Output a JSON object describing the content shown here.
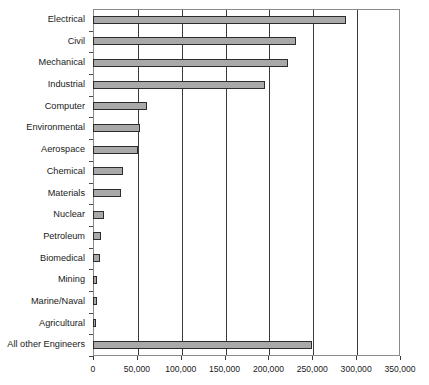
{
  "chart_data": {
    "type": "bar",
    "orientation": "horizontal",
    "title": "",
    "subtitle": "",
    "xlabel": "",
    "ylabel": "",
    "xlim": [
      0,
      350000
    ],
    "ylim": null,
    "grid": true,
    "legend": null,
    "legend_position": "none",
    "tick_step": 50000,
    "xticks": [
      0,
      50000,
      100000,
      150000,
      200000,
      250000,
      300000,
      350000
    ],
    "xtick_labels": [
      "0",
      "50,000",
      "100,000",
      "150,000",
      "200,000",
      "250,000",
      "300,000",
      "350,000"
    ],
    "categories": [
      "Electrical",
      "Civil",
      "Mechanical",
      "Industrial",
      "Computer",
      "Environmental",
      "Aerospace",
      "Chemical",
      "Materials",
      "Nuclear",
      "Petroleum",
      "Biomedical",
      "Mining",
      "Marine/Naval",
      "Agricultural",
      "All other Engineers"
    ],
    "values": [
      288000,
      231000,
      222000,
      196000,
      61000,
      54000,
      51000,
      34000,
      32000,
      13000,
      9000,
      8000,
      5000,
      4000,
      2000,
      250000
    ],
    "series": [
      {
        "name": "Number of engineers",
        "values": [
          288000,
          231000,
          222000,
          196000,
          61000,
          54000,
          51000,
          34000,
          32000,
          13000,
          9000,
          8000,
          5000,
          4000,
          2000,
          250000
        ]
      }
    ],
    "colors": {
      "bar_fill": "#a9a9a9",
      "bar_stroke": "#2c2c2c",
      "gridline": "#3a3a3a",
      "plot_border": "#8a8a8a",
      "text": "#1a1a1a",
      "background": "#ffffff"
    }
  }
}
